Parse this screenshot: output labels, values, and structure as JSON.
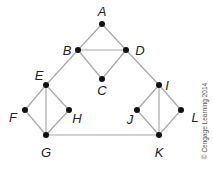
{
  "graph": {
    "nodes": [
      {
        "id": "A",
        "x": 102,
        "y": 24,
        "lx": 102,
        "ly": 16
      },
      {
        "id": "B",
        "x": 78,
        "y": 50,
        "lx": 67,
        "ly": 55
      },
      {
        "id": "C",
        "x": 102,
        "y": 79,
        "lx": 102,
        "ly": 95
      },
      {
        "id": "D",
        "x": 126,
        "y": 50,
        "lx": 140,
        "ly": 55
      },
      {
        "id": "E",
        "x": 46,
        "y": 85,
        "lx": 39,
        "ly": 80
      },
      {
        "id": "F",
        "x": 25,
        "y": 110,
        "lx": 13,
        "ly": 122
      },
      {
        "id": "G",
        "x": 46,
        "y": 135,
        "lx": 46,
        "ly": 157
      },
      {
        "id": "H",
        "x": 69,
        "y": 110,
        "lx": 77,
        "ly": 123
      },
      {
        "id": "I",
        "x": 159,
        "y": 85,
        "lx": 167,
        "ly": 90
      },
      {
        "id": "J",
        "x": 137,
        "y": 110,
        "lx": 130,
        "ly": 124
      },
      {
        "id": "K",
        "x": 159,
        "y": 135,
        "lx": 159,
        "ly": 157
      },
      {
        "id": "L",
        "x": 181,
        "y": 110,
        "lx": 195,
        "ly": 122
      }
    ],
    "edges": [
      [
        "A",
        "B"
      ],
      [
        "A",
        "D"
      ],
      [
        "B",
        "D"
      ],
      [
        "B",
        "C"
      ],
      [
        "C",
        "D"
      ],
      [
        "B",
        "E"
      ],
      [
        "D",
        "I"
      ],
      [
        "E",
        "F"
      ],
      [
        "E",
        "H"
      ],
      [
        "E",
        "G"
      ],
      [
        "F",
        "G"
      ],
      [
        "H",
        "G"
      ],
      [
        "I",
        "J"
      ],
      [
        "I",
        "L"
      ],
      [
        "I",
        "K"
      ],
      [
        "J",
        "K"
      ],
      [
        "L",
        "K"
      ],
      [
        "G",
        "K"
      ]
    ]
  },
  "copyright": "© Cengage Learning 2014"
}
